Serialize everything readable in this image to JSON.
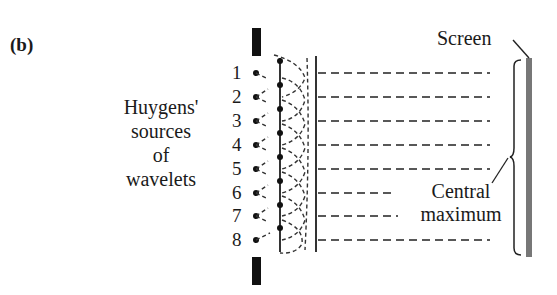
{
  "figure": {
    "panel_label": "(b)",
    "left_label": [
      "Huygens'",
      "sources",
      "of",
      "wavelets"
    ],
    "screen_label": "Screen",
    "central_label": [
      "Central",
      "maximum"
    ],
    "source_numbers": [
      "1",
      "2",
      "3",
      "4",
      "5",
      "6",
      "7",
      "8"
    ]
  }
}
